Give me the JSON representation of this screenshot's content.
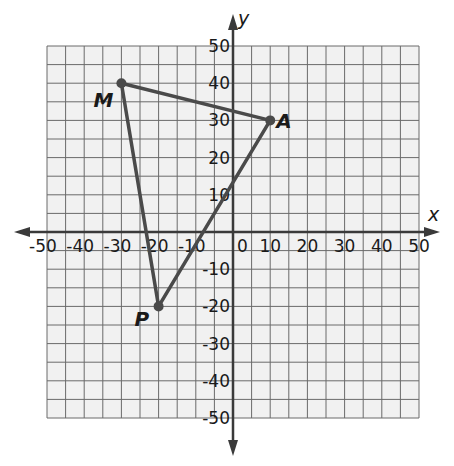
{
  "chart_data": {
    "type": "scatter",
    "title": "",
    "xlabel": "x",
    "ylabel": "y",
    "xlim": [
      -50,
      50
    ],
    "ylim": [
      -50,
      50
    ],
    "grid": true,
    "grid_step": 5,
    "label_step": 10,
    "x_tick_labels": [
      "-50",
      "-40",
      "-30",
      "-20",
      "-10",
      "0",
      "10",
      "20",
      "30",
      "40",
      "50"
    ],
    "y_tick_labels": [
      "50",
      "40",
      "30",
      "20",
      "10",
      "-10",
      "-20",
      "-30",
      "-40",
      "-50"
    ],
    "points": [
      {
        "name": "M",
        "x": -30,
        "y": 40
      },
      {
        "name": "A",
        "x": 10,
        "y": 30
      },
      {
        "name": "P",
        "x": -20,
        "y": -20
      }
    ],
    "polygon": [
      "M",
      "A",
      "P"
    ],
    "colors": {
      "grid_fill": "#f1f1f1",
      "grid_line": "#6a6a6a",
      "axis": "#3a3a3a",
      "triangle": "#4a4a4a",
      "text": "#1a1a1a"
    }
  }
}
